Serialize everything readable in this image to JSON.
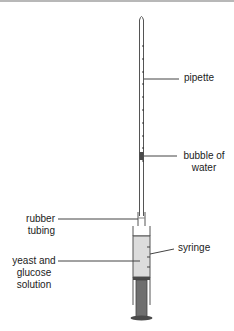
{
  "diagram": {
    "labels": {
      "pipette": "pipette",
      "bubble_line1": "bubble of",
      "bubble_line2": "water",
      "rubber_line1": "rubber",
      "rubber_line2": "tubing",
      "yeast_line1": "yeast and",
      "yeast_line2": "glucose",
      "yeast_line3": "solution",
      "syringe": "syringe"
    },
    "colors": {
      "outline": "#555555",
      "solution_fill": "#dcdcdc",
      "plunger_fill": "#6e6e6e",
      "bubble_fill": "#4a4a4a",
      "leader_line": "#444444"
    },
    "components": [
      "pipette",
      "bubble of water",
      "rubber tubing",
      "syringe",
      "yeast and glucose solution",
      "plunger"
    ]
  }
}
